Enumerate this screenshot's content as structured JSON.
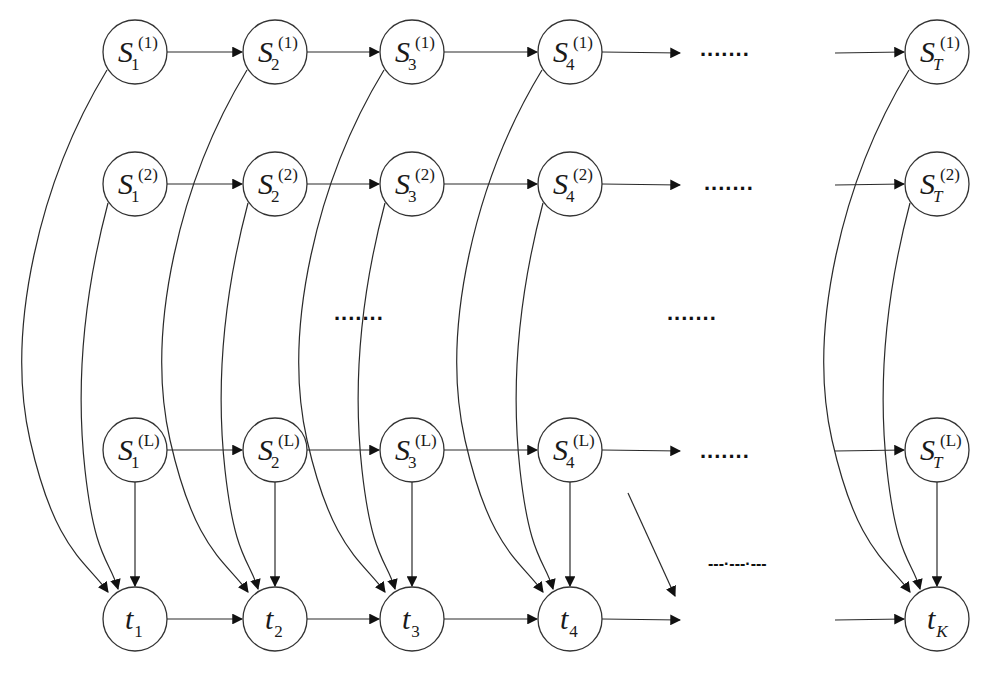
{
  "diagram": {
    "type": "directed graphical model (coupled state chains to time nodes)",
    "columns": [
      {
        "key": "1",
        "x": 135
      },
      {
        "key": "2",
        "x": 275
      },
      {
        "key": "3",
        "x": 412
      },
      {
        "key": "4",
        "x": 570
      },
      {
        "key": "T",
        "x": 937
      }
    ],
    "rows": [
      {
        "key": "(1)",
        "y": 52
      },
      {
        "key": "(2)",
        "y": 184
      },
      {
        "key": "(L)",
        "y": 450
      }
    ],
    "state_nodes": [
      {
        "id": "S1_1",
        "base": "S",
        "sub": "1",
        "sup": "(1)",
        "x": 135,
        "y": 52
      },
      {
        "id": "S2_1",
        "base": "S",
        "sub": "2",
        "sup": "(1)",
        "x": 275,
        "y": 52
      },
      {
        "id": "S3_1",
        "base": "S",
        "sub": "3",
        "sup": "(1)",
        "x": 412,
        "y": 52
      },
      {
        "id": "S4_1",
        "base": "S",
        "sub": "4",
        "sup": "(1)",
        "x": 570,
        "y": 52
      },
      {
        "id": "ST_1",
        "base": "S",
        "sub": "T",
        "sup": "(1)",
        "x": 937,
        "y": 52
      },
      {
        "id": "S1_2",
        "base": "S",
        "sub": "1",
        "sup": "(2)",
        "x": 135,
        "y": 184
      },
      {
        "id": "S2_2",
        "base": "S",
        "sub": "2",
        "sup": "(2)",
        "x": 275,
        "y": 184
      },
      {
        "id": "S3_2",
        "base": "S",
        "sub": "3",
        "sup": "(2)",
        "x": 412,
        "y": 184
      },
      {
        "id": "S4_2",
        "base": "S",
        "sub": "4",
        "sup": "(2)",
        "x": 570,
        "y": 184
      },
      {
        "id": "ST_2",
        "base": "S",
        "sub": "T",
        "sup": "(2)",
        "x": 937,
        "y": 184
      },
      {
        "id": "S1_L",
        "base": "S",
        "sub": "1",
        "sup": "(L)",
        "x": 135,
        "y": 450
      },
      {
        "id": "S2_L",
        "base": "S",
        "sub": "2",
        "sup": "(L)",
        "x": 275,
        "y": 450
      },
      {
        "id": "S3_L",
        "base": "S",
        "sub": "3",
        "sup": "(L)",
        "x": 412,
        "y": 450
      },
      {
        "id": "S4_L",
        "base": "S",
        "sub": "4",
        "sup": "(L)",
        "x": 570,
        "y": 450
      },
      {
        "id": "ST_L",
        "base": "S",
        "sub": "T",
        "sup": "(L)",
        "x": 937,
        "y": 450
      }
    ],
    "time_nodes": [
      {
        "id": "t1",
        "base": "t",
        "sub": "1",
        "x": 135,
        "y": 619
      },
      {
        "id": "t2",
        "base": "t",
        "sub": "2",
        "x": 275,
        "y": 619
      },
      {
        "id": "t3",
        "base": "t",
        "sub": "3",
        "x": 412,
        "y": 619
      },
      {
        "id": "t4",
        "base": "t",
        "sub": "4",
        "x": 570,
        "y": 619
      },
      {
        "id": "tK",
        "base": "t",
        "sub": "K",
        "x": 937,
        "y": 619
      }
    ],
    "ellipses": [
      {
        "id": "row1-dots",
        "text": ".......",
        "x": 700,
        "y": 56
      },
      {
        "id": "row2-dots",
        "text": ".......",
        "x": 704,
        "y": 190
      },
      {
        "id": "mid-left-dots",
        "text": ".......",
        "x": 334,
        "y": 320
      },
      {
        "id": "mid-right-dots",
        "text": ".......",
        "x": 667,
        "y": 320
      },
      {
        "id": "rowL-dots",
        "text": ".......",
        "x": 700,
        "y": 458
      },
      {
        "id": "bottom-dashes",
        "text": "---·---·---",
        "x": 708,
        "y": 569
      }
    ],
    "node_radius": 32,
    "stroke_color": "#333333",
    "background": "#ffffff"
  }
}
